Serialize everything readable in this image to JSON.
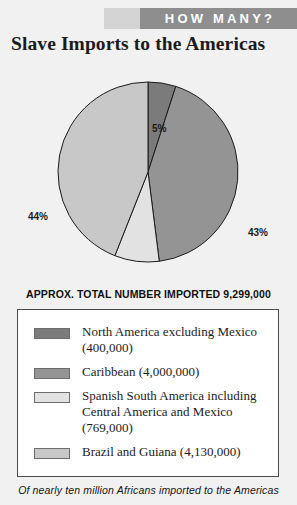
{
  "banner": {
    "label": "HOW MANY?",
    "bg_color": "#8e8e8e",
    "accent_color": "#d4d4d4",
    "text_color": "#ffffff"
  },
  "title": "Slave Imports to the Americas",
  "total_line": "APPROX. TOTAL NUMBER IMPORTED 9,299,000",
  "caption": "Of nearly ten million Africans imported to the Americas",
  "legend": {
    "items": [
      {
        "label": "North America excluding Mexico (400,000)",
        "color": "#7b7b7b"
      },
      {
        "label": "Caribbean (4,000,000)",
        "color": "#949494"
      },
      {
        "label": "Spanish South America including Central America and Mexico (769,000)",
        "color": "#e2e2e2"
      },
      {
        "label": "Brazil and Guiana (4,130,000)",
        "color": "#c8c8c8"
      }
    ]
  },
  "chart_data": {
    "type": "pie",
    "title": "Slave Imports to the Americas",
    "subtitle": "APPROX. TOTAL NUMBER IMPORTED 9,299,000",
    "total": 9299000,
    "legend_position": "below",
    "grid": false,
    "labels": [
      "North America excluding Mexico",
      "Caribbean",
      "Spanish South America including Central America and Mexico",
      "Brazil and Guiana"
    ],
    "values": [
      400000,
      4000000,
      769000,
      4130000
    ],
    "percent_labels": [
      "5%",
      "43%",
      "8%",
      "44%"
    ],
    "percents": [
      5,
      43,
      8,
      44
    ],
    "colors": [
      "#7b7b7b",
      "#949494",
      "#e2e2e2",
      "#c8c8c8"
    ],
    "slice_order": "clockwise-from-top",
    "stroke_color": "#1b1b1b"
  }
}
